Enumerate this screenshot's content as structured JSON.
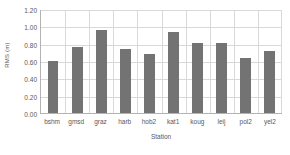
{
  "chart_data": {
    "type": "bar",
    "title": "",
    "xlabel": "Station",
    "ylabel": "RMS (m)",
    "categories": [
      "bshm",
      "gmsd",
      "graz",
      "harb",
      "hob2",
      "kat1",
      "koug",
      "leij",
      "pol2",
      "yel2"
    ],
    "values": [
      0.6,
      0.76,
      0.96,
      0.74,
      0.68,
      0.94,
      0.81,
      0.81,
      0.63,
      0.72
    ],
    "ylim": [
      0.0,
      1.2
    ],
    "ytick_labels": [
      "0.00",
      "0.20",
      "0.40",
      "0.60",
      "0.80",
      "1.00",
      "1.20"
    ],
    "ytick_values": [
      0.0,
      0.2,
      0.4,
      0.6,
      0.8,
      1.0,
      1.2
    ],
    "grid": true,
    "legend": false,
    "legend_position": "none",
    "series": [
      {
        "name": "RMS",
        "color": "#737373",
        "values": [
          0.6,
          0.76,
          0.96,
          0.74,
          0.68,
          0.94,
          0.81,
          0.81,
          0.63,
          0.72
        ]
      }
    ]
  },
  "colors": {
    "bar": "#737373",
    "grid": "#d9d9d9",
    "axis": "#b3b3b3",
    "text": "#595959",
    "background": "#ffffff"
  }
}
